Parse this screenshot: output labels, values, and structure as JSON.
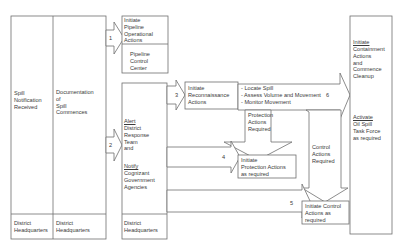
{
  "diagram": {
    "type": "flowchart",
    "topic": "Oil spill response process",
    "boxes": {
      "spill_notification": {
        "text": "Spill\nNotification\nReceived",
        "footer": "District\nHeadquarters"
      },
      "documentation": {
        "text": "Documentation\nof\nSpill\nCommences",
        "footer": "District\nHeadquarters"
      },
      "pipeline_ops": {
        "title": "Initiate\nPipeline\nOperational\nActions",
        "sub": "Pipeline\nControl\nCenter"
      },
      "alert": {
        "alert_title": "Alert",
        "alert_text": "District\nResponse\nTeam\nand",
        "notify_title": "Notify",
        "notify_text": "Cognizant\nGovernment\nAgencies",
        "footer": "District\nHeadquarters"
      },
      "reconnaissance": {
        "text": "Initiate\nReconnaissance\nActions"
      },
      "recon_tasks": {
        "text": "- Locate Spill\n- Assess Volume and Movement\n- Monitor Movement"
      },
      "protection": {
        "text": "Initiate\nProtection Actions\nas required"
      },
      "control": {
        "text": "Initiate Control\nActions as\nrequired"
      },
      "containment": {
        "title": "Initiate",
        "text": "Containment\nActions\nand\nCommence\nCleanup",
        "task_title": "Activate",
        "task_text": "Oil Spill\nTask Force\nas required"
      }
    },
    "arrows": {
      "a1": "1",
      "a2": "2",
      "a3": "3",
      "a4": "4",
      "a5": "5",
      "a6": "6",
      "protection_required": "Protection\nActions\nRequired",
      "control_required": "Control\nActions\nRequired"
    }
  }
}
